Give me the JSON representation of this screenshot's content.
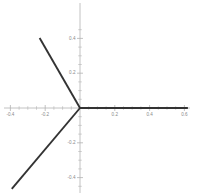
{
  "chart_data": {
    "type": "line",
    "title": "",
    "subtitle": "",
    "xlabel": "",
    "ylabel": "",
    "xlim": [
      -0.46,
      0.67
    ],
    "ylim": [
      -0.62,
      0.5
    ],
    "grid": false,
    "legend": null,
    "background_color": "#ffffff",
    "axis_color": "#b3b3b3",
    "line_color": "#333333",
    "tick_label_color": "#8a8a8a",
    "xticks": [
      -0.4,
      -0.2,
      0.2,
      0.4,
      0.6
    ],
    "xtick_labels": [
      "-0.4",
      "-0.2",
      "0.2",
      "0.4",
      "0.6"
    ],
    "yticks": [
      -0.4,
      -0.2,
      0.2,
      0.4
    ],
    "ytick_labels": [
      "-0.4",
      "-0.2",
      "0.2",
      "0.4"
    ],
    "minor_tick_step": 0.05,
    "series": [
      {
        "name": "ray-right",
        "angle_deg": 0,
        "points": [
          [
            0.0,
            0.0
          ],
          [
            0.62,
            0.0
          ]
        ]
      },
      {
        "name": "ray-upper-left",
        "angle_deg": 120,
        "points": [
          [
            0.0,
            0.0
          ],
          [
            -0.232,
            0.402
          ]
        ]
      },
      {
        "name": "ray-lower-left",
        "angle_deg": 240,
        "points": [
          [
            0.0,
            0.0
          ],
          [
            -0.392,
            -0.465
          ]
        ]
      }
    ]
  }
}
